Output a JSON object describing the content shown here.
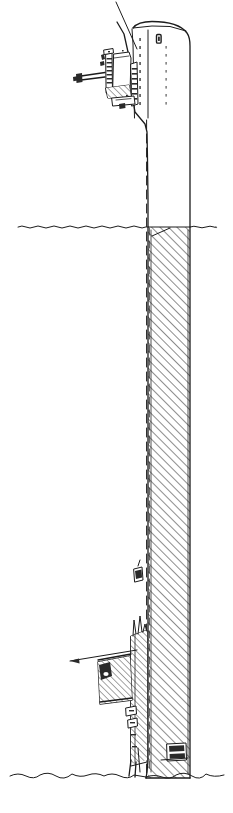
{
  "figure": {
    "type": "technical-line-drawing",
    "style": "hand-drawn ink line drawing, black on white",
    "canvas": {
      "width": 233,
      "height": 813
    },
    "stroke_color": "#1c1c1c",
    "background_color": "#ffffff"
  },
  "environment": {
    "waterline": {
      "label": "water surface",
      "y": 227,
      "x_start": 18,
      "x_end": 216,
      "style": "wavy horizontal line",
      "amplitude": 1.6
    },
    "seabed": {
      "label": "sea bed / ground line",
      "y": 775,
      "x_start": 10,
      "x_end": 224,
      "style": "irregular wavy horizontal line",
      "amplitude": 3.5
    }
  },
  "structure": {
    "name": "tower-shaft",
    "left_edge_x": 148,
    "right_edge_x": 190,
    "top_y": 22,
    "bottom_y": 778,
    "crown": {
      "label": "rounded top cap",
      "radius": 16
    },
    "above_water": {
      "label": "emergent section",
      "from_y": 22,
      "to_y": 227,
      "fill": "white (unsectioned)"
    },
    "below_water": {
      "label": "submerged sectioned shaft",
      "from_y": 227,
      "to_y": 778,
      "fill": "45 degree diagonal hatching",
      "hatch_angle_deg": 45,
      "hatch_spacing_px": 6
    },
    "seam_line": {
      "label": "vertical dashed seam / ladder rail",
      "x": 147,
      "from_y": 120,
      "to_y": 775,
      "style": "dashed"
    },
    "rivet_columns": [
      {
        "label": "rivet seam A",
        "x": 140,
        "from_y": 36,
        "to_y": 112
      },
      {
        "label": "rivet seam B",
        "x": 166,
        "from_y": 44,
        "to_y": 110
      }
    ],
    "marks": [
      {
        "label": "hatch plate mark",
        "x": 157,
        "y": 38,
        "w": 5,
        "h": 9
      }
    ]
  },
  "details": [
    {
      "name": "upper-machinery-assembly",
      "label": "upper bracket and machinery detail",
      "bbox": {
        "x": 74,
        "y": 48,
        "w": 56,
        "h": 54
      },
      "description": "cantilevered bracket with vertical plate, stepped flange, hatched blocks and projecting arm"
    },
    {
      "name": "lower-attachment-detail",
      "label": "lower attachment / boat landing detail",
      "bbox": {
        "x": 96,
        "y": 628,
        "w": 50,
        "h": 96
      },
      "description": "hatched block fixed to shaft face with flange plates and small fittings"
    },
    {
      "name": "mid-shaft-fitting",
      "label": "small fitting on shaft face",
      "bbox": {
        "x": 133,
        "y": 568,
        "w": 10,
        "h": 14
      }
    },
    {
      "name": "base-fitting",
      "label": "base fitting near seabed",
      "bbox": {
        "x": 167,
        "y": 744,
        "w": 18,
        "h": 16
      }
    }
  ],
  "annotations": [
    {
      "name": "upper-leader-line",
      "label": "leader line to upper assembly",
      "from": {
        "x": 116,
        "y": 2
      },
      "to": {
        "x": 136,
        "y": 48
      },
      "arrow": false
    },
    {
      "name": "lower-leader-line",
      "label": "leader line with arrowhead to lower detail",
      "from": {
        "x": 137,
        "y": 650
      },
      "to": {
        "x": 69,
        "y": 662
      },
      "arrow": true,
      "arrow_direction": "left"
    }
  ],
  "legend": {
    "hatching_meaning": "material cut by section plane",
    "line_weights": [
      "hairline 0.75",
      "thin 1.0",
      "medium 1.3",
      "heavy 1.8"
    ]
  }
}
